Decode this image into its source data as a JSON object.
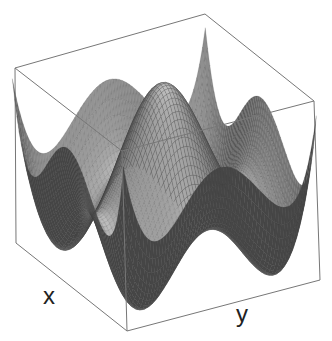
{
  "chart_data": {
    "type": "surface3d",
    "title": "",
    "xlabel": "x",
    "ylabel": "y",
    "zlabel": "",
    "function_description": "Quartic surface with four tall peaks at the corners of the domain, a shallow ring-shaped valley, and a gentle central bump (e.g. z = x^4 + y^4 - c(x^2 + y^2) style)",
    "x_range": [
      -1,
      1
    ],
    "y_range": [
      -1,
      1
    ],
    "grid_resolution": 60,
    "ticks_visible": false,
    "box_visible": true,
    "colormap": "gray",
    "edge_color": "#3a3a3a",
    "face_color_light": "#bdbdbd",
    "face_color_dark": "#4a4a4a",
    "box_color": "#777777",
    "box_corners_px": {
      "top_left": [
        15,
        68
      ],
      "top_back": [
        207,
        18
      ],
      "top_right": [
        314,
        101
      ],
      "top_front": [
        122,
        151
      ],
      "bottom_left": [
        16,
        243
      ],
      "bottom_front": [
        127,
        331
      ],
      "bottom_right": [
        320,
        280
      ]
    },
    "features": {
      "corner_peaks": 4,
      "central_bump": true,
      "ring_valley": true
    }
  },
  "labels": {
    "x": "x",
    "y": "y"
  }
}
